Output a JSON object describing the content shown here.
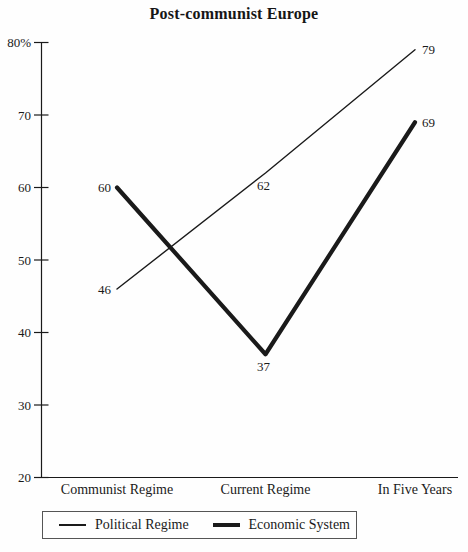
{
  "title": "Post-communist Europe",
  "chart_data": {
    "type": "line",
    "categories": [
      "Communist Regime",
      "Current Regime",
      "In Five Years"
    ],
    "series": [
      {
        "name": "Political Regime",
        "values": [
          46,
          62,
          79
        ],
        "line_style": "thin"
      },
      {
        "name": "Economic System",
        "values": [
          60,
          37,
          69
        ],
        "line_style": "thick"
      }
    ],
    "ylim": [
      20,
      80
    ],
    "y_ticks": [
      20,
      30,
      40,
      50,
      60,
      70,
      80
    ],
    "y_tick_labels": [
      "20",
      "30",
      "40",
      "50",
      "60",
      "70",
      "80%"
    ],
    "point_labels_shown": true,
    "grid": false,
    "legend_position": "bottom",
    "colors": {
      "line": "#1a1a1a",
      "text": "#1a1a1a",
      "legend_border": "#555555",
      "background": "#fefefe"
    }
  }
}
